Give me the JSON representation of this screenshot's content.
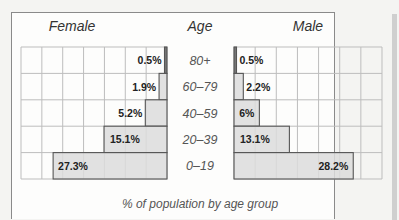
{
  "page_title_fragment": "Population Pyramid",
  "chart_data": {
    "type": "bar",
    "orientation": "horizontal",
    "subtype": "population-pyramid",
    "title": "",
    "xlabel": "% of population by age group",
    "category_header": "Age",
    "categories": [
      "80+",
      "60–79",
      "40–59",
      "20–39",
      "0–19"
    ],
    "series": [
      {
        "name": "Female",
        "side": "left",
        "values": [
          0.5,
          1.9,
          5.2,
          15.1,
          27.3
        ],
        "labels": [
          "0.5%",
          "1.9%",
          "5.2%",
          "15.1%",
          "27.3%"
        ]
      },
      {
        "name": "Male",
        "side": "right",
        "values": [
          0.5,
          2.2,
          6,
          13.1,
          28.2
        ],
        "labels": [
          "0.5%",
          "2.2%",
          "6%",
          "13.1%",
          "28.2%"
        ]
      }
    ],
    "xlim": [
      0,
      35
    ],
    "grid_step": 5,
    "grid": true,
    "colors": {
      "bar_fill": "#dcdcdc",
      "bar_stroke": "#555555",
      "thin_bar_fill": "#777777",
      "grid": "#bdbdbd"
    }
  }
}
